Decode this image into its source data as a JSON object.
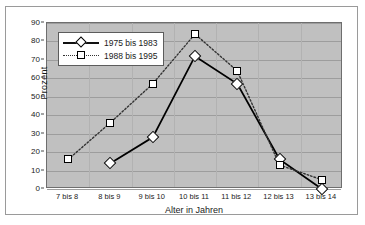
{
  "chart_data": {
    "type": "line",
    "title": "",
    "xlabel": "Alter in Jahren",
    "ylabel": "Prozent",
    "categories": [
      "7 bis 8",
      "8 bis 9",
      "9 bis 10",
      "10 bis 11",
      "11 bis 12",
      "12 bis 13",
      "13 bis 14"
    ],
    "ylim": [
      0,
      90
    ],
    "ytick_step": 10,
    "yticks": [
      0,
      10,
      20,
      30,
      40,
      50,
      60,
      70,
      80,
      90
    ],
    "grid": true,
    "legend_position": "upper-left-inside",
    "series": [
      {
        "name": "1975 bis 1983",
        "marker": "diamond",
        "linestyle": "solid",
        "color": "#000000",
        "values": [
          null,
          14,
          28,
          72,
          57,
          16,
          0
        ]
      },
      {
        "name": "1988 bis 1995",
        "marker": "square",
        "linestyle": "dotted",
        "color": "#333333",
        "values": [
          16,
          36,
          57,
          84,
          64,
          13,
          5
        ]
      }
    ]
  },
  "axis": {
    "ylabel": "Prozent",
    "xlabel": "Alter in Jahren"
  },
  "legend": {
    "items": [
      {
        "label": "1975 bis 1983"
      },
      {
        "label": "1988 bis 1995"
      }
    ]
  },
  "colors": {
    "plot_background": "#c0c0c0",
    "grid": "#9d9d9d",
    "frame": "#9a9a9a",
    "series_1": "#000000",
    "series_2": "#333333"
  }
}
